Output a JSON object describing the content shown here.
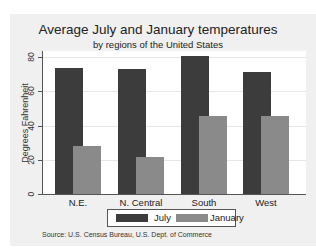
{
  "chart_data": {
    "type": "bar",
    "title": "Average July and January temperatures",
    "subtitle": "by regions of the United States",
    "xlabel": "",
    "ylabel": "Degrees Fahrenheit",
    "ylim": [
      0,
      85
    ],
    "yticks": [
      "0",
      "20",
      "40",
      "60",
      "80"
    ],
    "grid": true,
    "categories": [
      "N.E.",
      "N. Central",
      "South",
      "West"
    ],
    "series": [
      {
        "name": "July",
        "values": [
          73.5,
          73.3,
          80.7,
          71.6
        ],
        "color": "#3c3c3c"
      },
      {
        "name": "January",
        "values": [
          27.9,
          21.6,
          45.6,
          45.5
        ],
        "color": "#8a8a8a"
      }
    ],
    "legend": {
      "position": "bottom",
      "entries": [
        "July",
        "January"
      ]
    },
    "note": "Source:  U.S. Census Bureau, U.S. Dept. of Commerce"
  }
}
